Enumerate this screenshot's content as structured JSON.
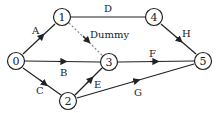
{
  "diagram": {
    "type": "activity-network",
    "nodes": [
      {
        "id": "0",
        "label": "0",
        "x": 16,
        "y": 61
      },
      {
        "id": "1",
        "label": "1",
        "x": 62,
        "y": 17
      },
      {
        "id": "2",
        "label": "2",
        "x": 68,
        "y": 101
      },
      {
        "id": "3",
        "label": "3",
        "x": 109,
        "y": 62
      },
      {
        "id": "4",
        "label": "4",
        "x": 154,
        "y": 17
      },
      {
        "id": "5",
        "label": "5",
        "x": 203,
        "y": 61
      }
    ],
    "edges": [
      {
        "label": "A",
        "from": "0",
        "to": "1"
      },
      {
        "label": "B",
        "from": "0",
        "to": "3"
      },
      {
        "label": "C",
        "from": "0",
        "to": "2"
      },
      {
        "label": "D",
        "from": "1",
        "to": "4"
      },
      {
        "label": "Dummy",
        "from": "1",
        "to": "3",
        "dashed": true
      },
      {
        "label": "E",
        "from": "2",
        "to": "3"
      },
      {
        "label": "F",
        "from": "3",
        "to": "5"
      },
      {
        "label": "G",
        "from": "2",
        "to": "5"
      },
      {
        "label": "H",
        "from": "4",
        "to": "5"
      }
    ]
  }
}
